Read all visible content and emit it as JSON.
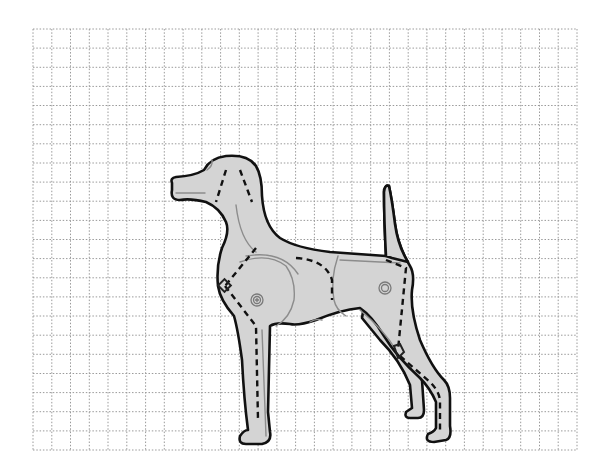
{
  "diagram": {
    "colors": {
      "background": "#ffffff",
      "grid": "#9a9a9a",
      "body_fill": "#d4d4d4",
      "outline": "#111111",
      "inner_contour": "#8c8c8c",
      "construction_dash": "#111111"
    },
    "grid": {
      "left": 33,
      "top": 29,
      "right": 577,
      "bottom": 450,
      "columns": 29,
      "rows": 22,
      "style": "dotted"
    },
    "parts": [
      {
        "name": "head"
      },
      {
        "name": "neck"
      },
      {
        "name": "torso"
      },
      {
        "name": "tail"
      },
      {
        "name": "front-leg-near"
      },
      {
        "name": "front-leg-far"
      },
      {
        "name": "hind-leg-near"
      },
      {
        "name": "hind-leg-far"
      }
    ],
    "pivots": [
      {
        "name": "shoulder-pivot",
        "cx": 257,
        "cy": 300
      },
      {
        "name": "hip-pivot",
        "cx": 385,
        "cy": 288
      }
    ],
    "joint_markers": [
      {
        "name": "elbow-marker",
        "x": 225,
        "y": 286
      },
      {
        "name": "hock-marker",
        "x": 397,
        "y": 353
      }
    ]
  }
}
